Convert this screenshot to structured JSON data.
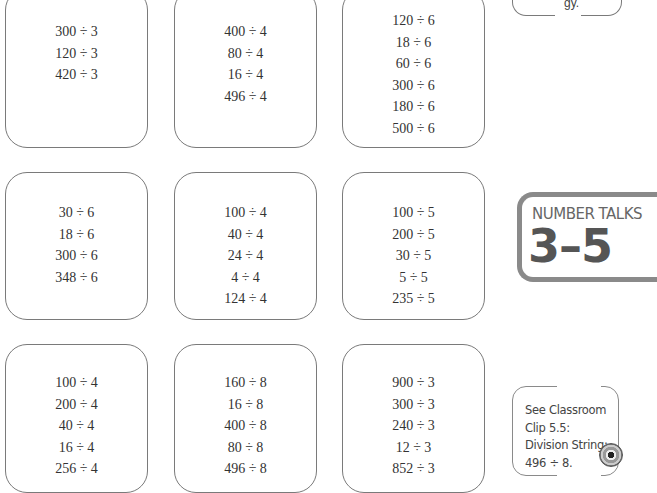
{
  "cards": [
    {
      "row": 1,
      "col": 1,
      "problems": [
        "300 ÷ 3",
        "120 ÷ 3",
        "420 ÷ 3"
      ]
    },
    {
      "row": 1,
      "col": 2,
      "problems": [
        "400 ÷ 4",
        "80 ÷ 4",
        "16 ÷ 4",
        "496 ÷ 4"
      ]
    },
    {
      "row": 1,
      "col": 3,
      "problems": [
        "120 ÷ 6",
        "18 ÷ 6",
        "60 ÷ 6",
        "300 ÷ 6",
        "180 ÷ 6",
        "500 ÷ 6"
      ]
    },
    {
      "row": 2,
      "col": 1,
      "problems": [
        "30 ÷ 6",
        "18 ÷ 6",
        "300 ÷ 6",
        "348 ÷ 6"
      ]
    },
    {
      "row": 2,
      "col": 2,
      "problems": [
        "100 ÷ 4",
        "40 ÷ 4",
        "24 ÷ 4",
        "4 ÷ 4",
        "124 ÷ 4"
      ]
    },
    {
      "row": 2,
      "col": 3,
      "problems": [
        "100 ÷ 5",
        "200 ÷ 5",
        "30 ÷ 5",
        "5 ÷ 5",
        "235 ÷ 5"
      ]
    },
    {
      "row": 3,
      "col": 1,
      "problems": [
        "100 ÷ 4",
        "200 ÷ 4",
        "40 ÷ 4",
        "16 ÷ 4",
        "256 ÷ 4"
      ]
    },
    {
      "row": 3,
      "col": 2,
      "problems": [
        "160 ÷ 8",
        "16 ÷ 8",
        "400 ÷ 8",
        "80 ÷ 8",
        "496 ÷ 8"
      ]
    },
    {
      "row": 3,
      "col": 3,
      "problems": [
        "900 ÷ 3",
        "300 ÷ 3",
        "240 ÷ 3",
        "12 ÷ 3",
        "852 ÷ 3"
      ]
    }
  ],
  "top_note": {
    "partial_text": "gy."
  },
  "badge": {
    "title": "NUMBER TALKS",
    "grade_range": "3–5"
  },
  "clip_note": {
    "lines": [
      "See Classroom",
      "Clip 5.5:",
      "Division String:",
      "496 ÷ 8."
    ],
    "icon": "disc-icon"
  }
}
